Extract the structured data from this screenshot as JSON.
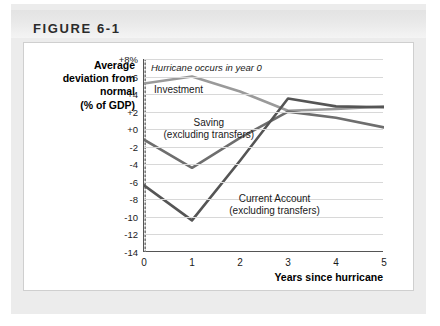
{
  "figure": {
    "title": "FIGURE 6-1"
  },
  "chart_data": {
    "type": "line",
    "title": "",
    "xlabel": "Years since hurricane",
    "ylabel": "Average deviation from normal (% of GDP)",
    "ylabel_lines": [
      "Average",
      "deviation from",
      "normal",
      "(% of GDP)"
    ],
    "x": [
      0,
      1,
      2,
      3,
      4,
      5
    ],
    "xlim": [
      0,
      5
    ],
    "ylim": [
      -14,
      8
    ],
    "ytick_labels": [
      "+8%",
      "+6",
      "+4",
      "+2",
      "+0",
      "-2",
      "-4",
      "-6",
      "-8",
      "-10",
      "-12",
      "-14"
    ],
    "ytick_values": [
      8,
      6,
      4,
      2,
      0,
      -2,
      -4,
      -6,
      -8,
      -10,
      -12,
      -14
    ],
    "xtick_labels": [
      "0",
      "1",
      "2",
      "3",
      "4",
      "5"
    ],
    "grid": true,
    "legend_position": "inline-annotations",
    "annotations": [
      {
        "text": "Hurricane occurs in year 0",
        "x": 0,
        "y": 7.1,
        "style": "italic"
      }
    ],
    "vertical_marker": {
      "x": 0,
      "style": "dotted",
      "color": "#7a7a7a"
    },
    "series": [
      {
        "name": "Investment",
        "color": "#9a9a9a",
        "values": [
          5.2,
          6.0,
          4.3,
          2.1,
          2.3,
          2.6
        ],
        "label_x": 0.72,
        "label_y": 4.5
      },
      {
        "name": "Saving (excluding transfers)",
        "name_lines": [
          "Saving",
          "(excluding transfers)"
        ],
        "color": "#6e6e6e",
        "values": [
          -1.2,
          -4.4,
          -1.0,
          2.0,
          1.3,
          0.2
        ],
        "label_x": 1.35,
        "label_y": 0.0
      },
      {
        "name": "Current Account (excluding transfers)",
        "name_lines": [
          "Current Account",
          "(excluding transfers)"
        ],
        "color": "#555555",
        "values": [
          -6.4,
          -10.4,
          -3.6,
          3.5,
          2.6,
          2.5
        ],
        "label_x": 2.72,
        "label_y": -8.6
      }
    ]
  }
}
